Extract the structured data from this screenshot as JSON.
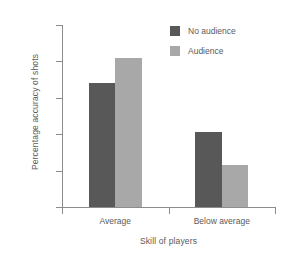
{
  "chart_data": {
    "type": "bar",
    "title": "",
    "subtitle": "",
    "xlabel": "Skill of players",
    "ylabel": "Percentage accuracy of shots",
    "categories": [
      "Average",
      "Below average"
    ],
    "series": [
      {
        "name": "No audience",
        "color": "#585858",
        "values": [
          68,
          41
        ]
      },
      {
        "name": "Audience",
        "color": "#a8a8a8",
        "values": [
          82,
          23
        ]
      }
    ],
    "ylim": [
      0,
      100
    ],
    "yticks": [
      0,
      20,
      40,
      60,
      80,
      100
    ],
    "ytick_labels": [
      "0",
      "20",
      "40",
      "60",
      "80",
      "100"
    ],
    "grid": false,
    "legend_position": "top-right",
    "axis_color": "#8c8c8c",
    "text_color": "#5a5a5a",
    "background": "#ffffff"
  }
}
